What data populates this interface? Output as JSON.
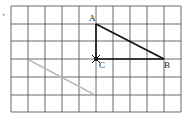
{
  "diagram": {
    "grid": {
      "x_lines": [
        11,
        28,
        45,
        62,
        79,
        96,
        113,
        130,
        147,
        164,
        181
      ],
      "y_lines": [
        6,
        24,
        41,
        59,
        77,
        95,
        112
      ],
      "line_color": "#444444"
    },
    "triangle": {
      "points": {
        "A": {
          "x": 96,
          "y": 24,
          "label": "A",
          "lx": 89,
          "ly": 21
        },
        "B": {
          "x": 164,
          "y": 59,
          "label": "B",
          "lx": 164,
          "ly": 68
        },
        "C": {
          "x": 96,
          "y": 59,
          "label": "C",
          "lx": 99,
          "ly": 68
        }
      },
      "stroke_color": "#111111"
    },
    "gray_segment": {
      "x1": 29,
      "y1": 60,
      "x2": 95,
      "y2": 95,
      "color": "#bbbbbb"
    },
    "marker_at": "C",
    "stray_mark": {
      "x": 3,
      "y": 14
    }
  }
}
